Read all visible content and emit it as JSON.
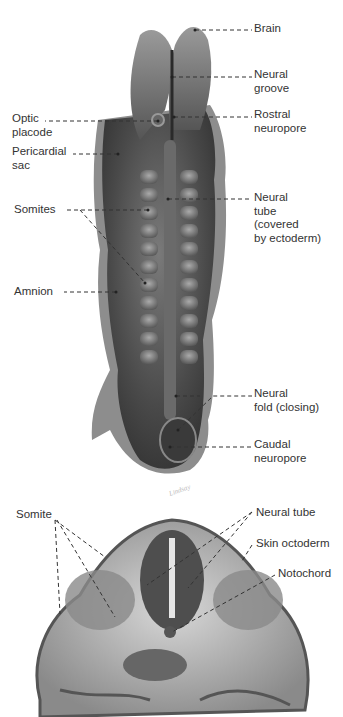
{
  "figure": {
    "top_panel": {
      "name": "Embryo dorsal view",
      "labels_right": [
        {
          "text": "Brain",
          "x": 254,
          "y": 20
        },
        {
          "text": "Neural\ngroove",
          "x": 254,
          "y": 67
        },
        {
          "text": "Rostral\nneuropore",
          "x": 254,
          "y": 107
        },
        {
          "text": "Neural\ntube\n(covered\nby ectoderm)",
          "x": 254,
          "y": 189
        },
        {
          "text": "Neural\nfold (closing)",
          "x": 254,
          "y": 386
        },
        {
          "text": "Caudal\nneuropore",
          "x": 254,
          "y": 436
        }
      ],
      "labels_left": [
        {
          "text": "Optic\nplacode",
          "x": 12,
          "y": 112
        },
        {
          "text": "Pericardial\nsac",
          "x": 12,
          "y": 143
        },
        {
          "text": "Somites",
          "x": 14,
          "y": 203
        },
        {
          "text": "Amnion",
          "x": 14,
          "y": 284
        }
      ],
      "signature": "Lindsay"
    },
    "bottom_panel": {
      "name": "Cross section",
      "labels": [
        {
          "text": "Somite",
          "x": 16,
          "y": 509
        },
        {
          "text": "Neural tube",
          "x": 256,
          "y": 507
        },
        {
          "text": "Skin octoderm",
          "x": 256,
          "y": 537
        },
        {
          "text": "Notochord",
          "x": 278,
          "y": 567
        }
      ]
    }
  }
}
